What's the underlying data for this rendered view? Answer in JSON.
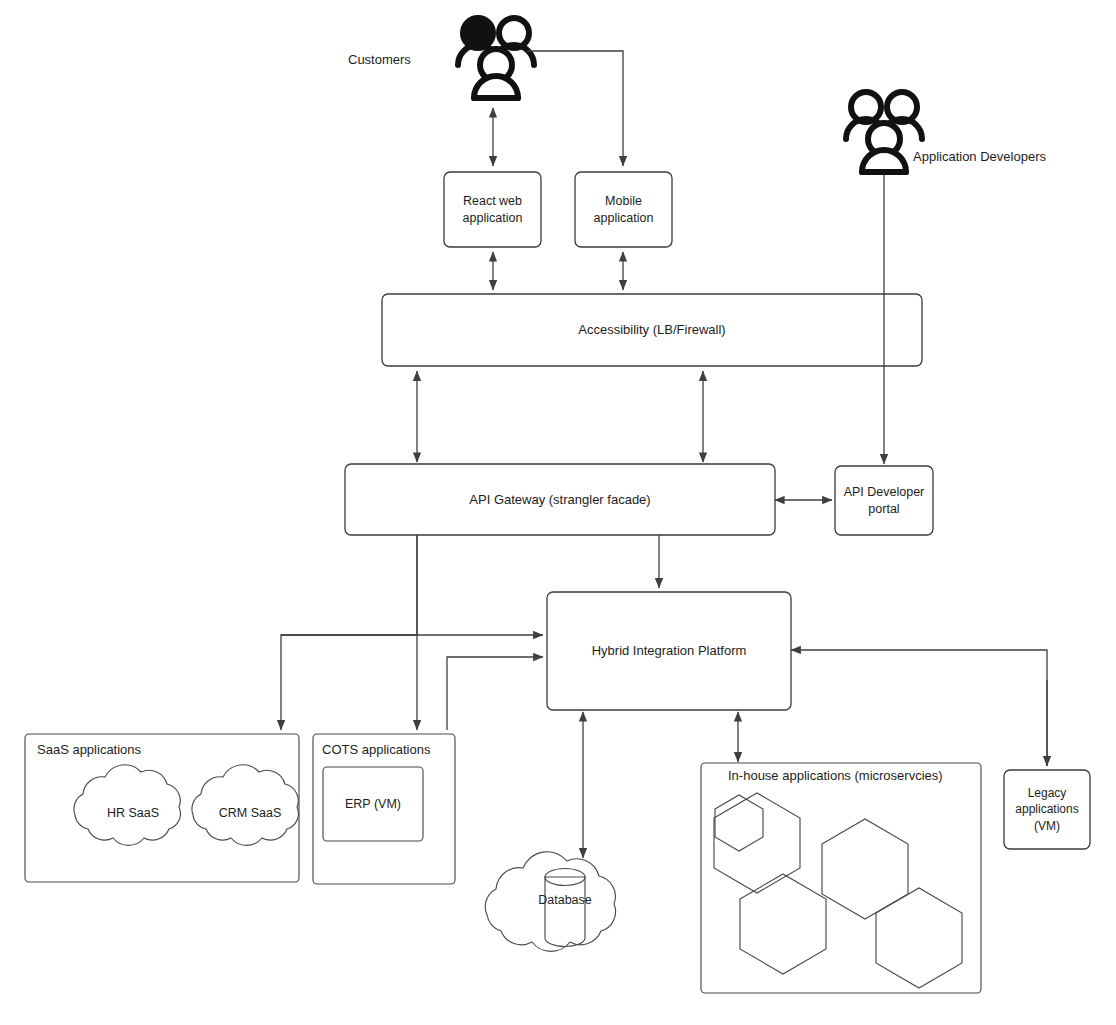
{
  "diagram": {
    "background_color": "#ffffff",
    "stroke_color": "#3a3a3a",
    "text_color": "#1d1d1d"
  },
  "actors": [
    {
      "id": "customers",
      "label": "Customers",
      "icon": "people-group-icon"
    },
    {
      "id": "app_developers",
      "label": "Application Developers",
      "icon": "people-group-icon"
    }
  ],
  "nodes": [
    {
      "id": "react_web",
      "label": "React web\napplication",
      "shape": "rounded-rect"
    },
    {
      "id": "mobile_app",
      "label": "Mobile\napplication",
      "shape": "rounded-rect"
    },
    {
      "id": "accessibility",
      "label": "Accessibility (LB/Firewall)",
      "shape": "rounded-rect"
    },
    {
      "id": "api_gateway",
      "label": "API Gateway (strangler facade)",
      "shape": "rounded-rect"
    },
    {
      "id": "api_portal",
      "label": "API Developer\nportal",
      "shape": "rounded-rect"
    },
    {
      "id": "hip",
      "label": "Hybrid Integration Platform",
      "shape": "rounded-rect"
    },
    {
      "id": "saas_group",
      "label": "SaaS applications",
      "shape": "container"
    },
    {
      "id": "hr_saas",
      "label": "HR SaaS",
      "shape": "cloud"
    },
    {
      "id": "crm_saas",
      "label": "CRM SaaS",
      "shape": "cloud"
    },
    {
      "id": "cots_group",
      "label": "COTS applications",
      "shape": "container"
    },
    {
      "id": "erp_vm",
      "label": "ERP (VM)",
      "shape": "rounded-rect"
    },
    {
      "id": "database",
      "label": "Database",
      "shape": "cylinder-in-cloud"
    },
    {
      "id": "inhouse_group",
      "label": "In-house applications (microservcies)",
      "shape": "container"
    },
    {
      "id": "microservice_1",
      "label": "",
      "shape": "hexagon"
    },
    {
      "id": "microservice_2",
      "label": "",
      "shape": "hexagon"
    },
    {
      "id": "microservice_3",
      "label": "",
      "shape": "hexagon"
    },
    {
      "id": "microservice_4",
      "label": "",
      "shape": "hexagon"
    },
    {
      "id": "legacy_apps",
      "label": "Legacy\napplications\n(VM)",
      "shape": "rounded-rect"
    }
  ],
  "edges": [
    {
      "from": "customers",
      "to": "react_web",
      "arrow": "both"
    },
    {
      "from": "customers",
      "to": "mobile_app",
      "arrow": "to"
    },
    {
      "from": "react_web",
      "to": "accessibility",
      "arrow": "both"
    },
    {
      "from": "mobile_app",
      "to": "accessibility",
      "arrow": "both"
    },
    {
      "from": "app_developers",
      "to": "api_portal",
      "arrow": "to"
    },
    {
      "from": "accessibility",
      "to": "api_gateway",
      "arrow": "both"
    },
    {
      "from": "api_gateway",
      "to": "api_portal",
      "arrow": "both"
    },
    {
      "from": "api_gateway",
      "to": "hip",
      "arrow": "to"
    },
    {
      "from": "api_gateway",
      "to": "saas_group",
      "arrow": "to"
    },
    {
      "from": "api_gateway",
      "to": "cots_group",
      "arrow": "to"
    },
    {
      "from": "hip",
      "to": "database",
      "arrow": "both"
    },
    {
      "from": "hip",
      "to": "inhouse_group",
      "arrow": "both"
    },
    {
      "from": "hip",
      "to": "legacy_apps",
      "arrow": "to"
    },
    {
      "from": "saas_group",
      "to": "hip",
      "arrow": "to"
    },
    {
      "from": "cots_group",
      "to": "hip",
      "arrow": "to"
    },
    {
      "from": "legacy_apps",
      "to": "hip",
      "arrow": "to"
    }
  ],
  "labels": {
    "customers": "Customers",
    "app_developers": "Application Developers",
    "react_web_l1": "React web",
    "react_web_l2": "application",
    "mobile_l1": "Mobile",
    "mobile_l2": "application",
    "accessibility": "Accessibility (LB/Firewall)",
    "api_gateway": "API Gateway (strangler facade)",
    "api_portal_l1": "API Developer",
    "api_portal_l2": "portal",
    "hip": "Hybrid Integration Platform",
    "saas_group": "SaaS applications",
    "hr_saas": "HR SaaS",
    "crm_saas": "CRM SaaS",
    "cots_group": "COTS applications",
    "erp_vm": "ERP (VM)",
    "database": "Database",
    "inhouse_group": "In-house applications (microservcies)",
    "legacy_l1": "Legacy",
    "legacy_l2": "applications",
    "legacy_l3": "(VM)"
  }
}
